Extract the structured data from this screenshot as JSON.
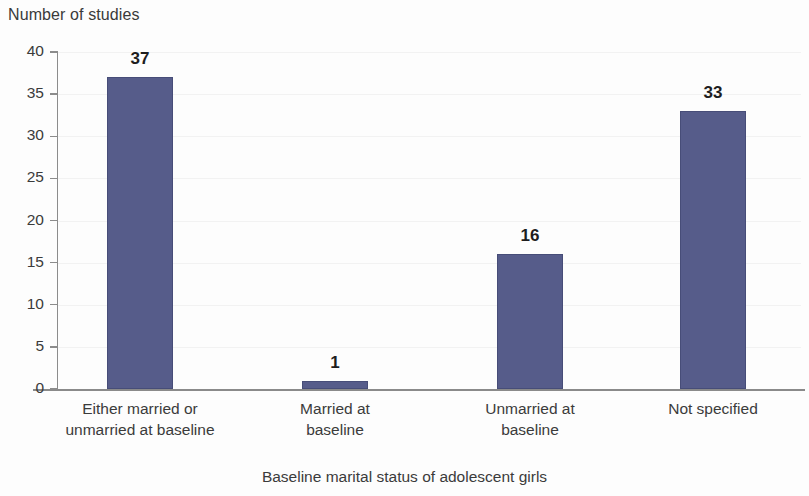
{
  "chart_data": {
    "type": "bar",
    "title": "",
    "xlabel": "Baseline marital status of adolescent girls",
    "ylabel": "Number of studies",
    "categories": [
      "Either married or unmarried at baseline",
      "Married at baseline",
      "Unmarried at baseline",
      "Not specified"
    ],
    "category_lines": [
      [
        "Either married or",
        "unmarried at baseline"
      ],
      [
        "Married at",
        "baseline"
      ],
      [
        "Unmarried at",
        "baseline"
      ],
      [
        "Not specified",
        ""
      ]
    ],
    "values": [
      37,
      1,
      16,
      33
    ],
    "value_labels": [
      "37",
      "1",
      "16",
      "33"
    ],
    "ylim": [
      0,
      40
    ],
    "ytick_labels": [
      "0",
      "5",
      "10",
      "15",
      "20",
      "25",
      "30",
      "35",
      "40"
    ],
    "ytick_values": [
      0,
      5,
      10,
      15,
      20,
      25,
      30,
      35,
      40
    ],
    "grid": true,
    "legend": false,
    "bar_color": "#565c8a",
    "bar_edge_color": "#474d78",
    "axis_color": "#8c8c8c",
    "text_color": "#3b3b3b"
  }
}
